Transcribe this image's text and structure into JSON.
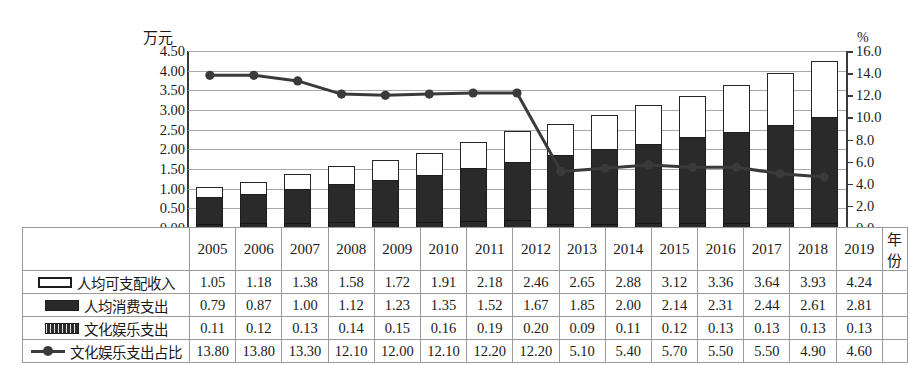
{
  "chart_data": {
    "type": "bar",
    "title": "",
    "subtitle": "",
    "xlabel": "年份",
    "ylabel": "万元",
    "ylabel_right": "%",
    "ylim": [
      0,
      4.5
    ],
    "ylim_right": [
      0,
      16
    ],
    "grid": true,
    "legend_position": "table-below",
    "categories": [
      "2005",
      "2006",
      "2007",
      "2008",
      "2009",
      "2010",
      "2011",
      "2012",
      "2013",
      "2014",
      "2015",
      "2016",
      "2017",
      "2018",
      "2019"
    ],
    "yticks_left": [
      "0.00",
      "0.50",
      "1.00",
      "1.50",
      "2.00",
      "2.50",
      "3.00",
      "3.50",
      "4.00",
      "4.50"
    ],
    "yticks_right": [
      "0.0",
      "2.0",
      "4.0",
      "6.0",
      "8.0",
      "10.0",
      "12.0",
      "14.0",
      "16.0"
    ],
    "series": [
      {
        "name": "人均可支配收入",
        "kind": "bar-stack-top",
        "axis": "left",
        "swatch": "white-outline",
        "values": [
          1.05,
          1.18,
          1.38,
          1.58,
          1.72,
          1.91,
          2.18,
          2.46,
          2.65,
          2.88,
          3.12,
          3.36,
          3.64,
          3.93,
          4.24
        ]
      },
      {
        "name": "人均消费支出",
        "kind": "bar-stack-bottom",
        "axis": "left",
        "swatch": "solid-black",
        "values": [
          0.79,
          0.87,
          1.0,
          1.12,
          1.23,
          1.35,
          1.52,
          1.67,
          1.85,
          2.0,
          2.14,
          2.31,
          2.44,
          2.61,
          2.81
        ]
      },
      {
        "name": "文化娱乐支出",
        "kind": "bar-inner",
        "axis": "left",
        "swatch": "hatched",
        "values": [
          0.11,
          0.12,
          0.13,
          0.14,
          0.15,
          0.16,
          0.19,
          0.2,
          0.09,
          0.11,
          0.12,
          0.13,
          0.13,
          0.13,
          0.13
        ]
      },
      {
        "name": "文化娱乐支出占比",
        "kind": "line",
        "axis": "right",
        "swatch": "line-marker",
        "values": [
          13.8,
          13.8,
          13.3,
          12.1,
          12.0,
          12.1,
          12.2,
          12.2,
          5.1,
          5.4,
          5.7,
          5.5,
          5.5,
          4.9,
          4.6
        ]
      }
    ]
  },
  "table": {
    "year_header": [
      "2005",
      "2006",
      "2007",
      "2008",
      "2009",
      "2010",
      "2011",
      "2012",
      "2013",
      "2014",
      "2015",
      "2016",
      "2017",
      "2018",
      "2019"
    ],
    "year_unit": "年份",
    "rows": [
      {
        "label": "人均可支配收入",
        "swatch": "white-outline",
        "values": [
          "1.05",
          "1.18",
          "1.38",
          "1.58",
          "1.72",
          "1.91",
          "2.18",
          "2.46",
          "2.65",
          "2.88",
          "3.12",
          "3.36",
          "3.64",
          "3.93",
          "4.24"
        ]
      },
      {
        "label": "人均消费支出",
        "swatch": "solid-black",
        "values": [
          "0.79",
          "0.87",
          "1.00",
          "1.12",
          "1.23",
          "1.35",
          "1.52",
          "1.67",
          "1.85",
          "2.00",
          "2.14",
          "2.31",
          "2.44",
          "2.61",
          "2.81"
        ]
      },
      {
        "label": "文化娱乐支出",
        "swatch": "hatched",
        "values": [
          "0.11",
          "0.12",
          "0.13",
          "0.14",
          "0.15",
          "0.16",
          "0.19",
          "0.20",
          "0.09",
          "0.11",
          "0.12",
          "0.13",
          "0.13",
          "0.13",
          "0.13"
        ]
      },
      {
        "label": "文化娱乐支出占比",
        "swatch": "line-marker",
        "values": [
          "13.80",
          "13.80",
          "13.30",
          "12.10",
          "12.00",
          "12.10",
          "12.20",
          "12.20",
          "5.10",
          "5.40",
          "5.70",
          "5.50",
          "5.50",
          "4.90",
          "4.60"
        ]
      }
    ]
  },
  "colors": {
    "bar_fill_dark": "#2a2a2a",
    "bar_fill_light": "#ffffff",
    "bar_stroke": "#1d1d1d",
    "line": "#3a3a3a",
    "gridline": "#a8a8a8",
    "axis": "#3a3a3a",
    "text": "#1a1a1a",
    "table_border": "#9a9a9a"
  }
}
